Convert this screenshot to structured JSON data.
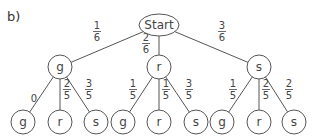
{
  "part_label": "b)",
  "root": {
    "label": "Start",
    "cx": 159,
    "cy": 25,
    "rx": 20,
    "ry": 11
  },
  "level1": [
    {
      "label": "g",
      "cx": 60,
      "cy": 67,
      "prob": {
        "num": "1",
        "den": "6"
      },
      "plx": 97,
      "ply": 30
    },
    {
      "label": "r",
      "cx": 159,
      "cy": 67,
      "prob": {
        "num": "2",
        "den": "6"
      },
      "plx": 146,
      "ply": 42
    },
    {
      "label": "s",
      "cx": 259,
      "cy": 67,
      "prob": {
        "num": "3",
        "den": "6"
      },
      "plx": 222,
      "ply": 30
    }
  ],
  "level2": [
    {
      "parent": 0,
      "label": "g",
      "cx": 23,
      "cy": 122,
      "prob": {
        "plain": "0"
      },
      "plx": 34,
      "ply": 98
    },
    {
      "parent": 0,
      "label": "r",
      "cx": 60,
      "cy": 122,
      "prob": {
        "num": "2",
        "den": "5"
      },
      "plx": 67,
      "ply": 88
    },
    {
      "parent": 0,
      "label": "s",
      "cx": 96,
      "cy": 122,
      "prob": {
        "num": "3",
        "den": "5"
      },
      "plx": 89,
      "ply": 88
    },
    {
      "parent": 1,
      "label": "g",
      "cx": 123,
      "cy": 122,
      "prob": {
        "num": "1",
        "den": "5"
      },
      "plx": 133,
      "ply": 88
    },
    {
      "parent": 1,
      "label": "r",
      "cx": 159,
      "cy": 122,
      "prob": {
        "num": "1",
        "den": "5"
      },
      "plx": 166,
      "ply": 88
    },
    {
      "parent": 1,
      "label": "s",
      "cx": 196,
      "cy": 122,
      "prob": {
        "num": "3",
        "den": "5"
      },
      "plx": 189,
      "ply": 88
    },
    {
      "parent": 2,
      "label": "g",
      "cx": 222,
      "cy": 122,
      "prob": {
        "num": "1",
        "den": "5"
      },
      "plx": 233,
      "ply": 88
    },
    {
      "parent": 2,
      "label": "r",
      "cx": 259,
      "cy": 122,
      "prob": {
        "num": "2",
        "den": "5"
      },
      "plx": 266,
      "ply": 88
    },
    {
      "parent": 2,
      "label": "s",
      "cx": 294,
      "cy": 122,
      "prob": {
        "num": "2",
        "den": "5"
      },
      "plx": 289,
      "ply": 88
    }
  ],
  "node_radius": 12
}
